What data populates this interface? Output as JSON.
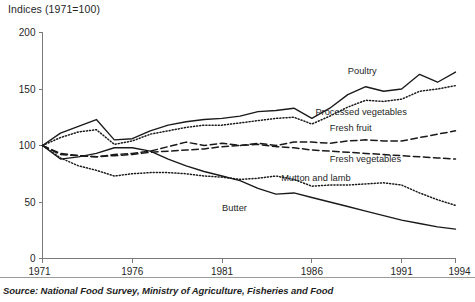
{
  "chart_data": {
    "type": "line",
    "title": "Indices (1971=100)",
    "xlabel": "",
    "ylabel": "Indices (1971=100)",
    "xlim": [
      1971,
      1994
    ],
    "ylim": [
      0,
      200
    ],
    "yticks": [
      0,
      50,
      100,
      150,
      200
    ],
    "xticks": [
      1971,
      1976,
      1981,
      1986,
      1991,
      1994
    ],
    "xtick_labels": [
      "1971",
      "1976",
      "1981",
      "1986",
      "1991",
      "1994"
    ],
    "ytick_labels": [
      "0",
      "50",
      "100",
      "150",
      "200"
    ],
    "grid": false,
    "legend_position": "inline-annotations",
    "x": [
      1971,
      1972,
      1973,
      1974,
      1975,
      1976,
      1977,
      1978,
      1979,
      1980,
      1981,
      1982,
      1983,
      1984,
      1985,
      1986,
      1987,
      1988,
      1989,
      1990,
      1991,
      1992,
      1993,
      1994
    ],
    "series": [
      {
        "name": "Poultry",
        "style": "solid",
        "label": "Poultry",
        "values": [
          100,
          111,
          117,
          123,
          105,
          106,
          113,
          118,
          121,
          123,
          124,
          126,
          130,
          131,
          133,
          124,
          133,
          145,
          152,
          148,
          150,
          163,
          156,
          165
        ]
      },
      {
        "name": "Processed vegetables",
        "style": "dotted",
        "label": "Processed vegetables",
        "values": [
          100,
          107,
          112,
          114,
          101,
          104,
          110,
          113,
          116,
          118,
          118,
          120,
          122,
          124,
          125,
          119,
          126,
          134,
          140,
          139,
          141,
          148,
          150,
          153
        ]
      },
      {
        "name": "Fresh fruit",
        "style": "dashed",
        "label": "Fresh fruit",
        "values": [
          100,
          92,
          91,
          90,
          92,
          93,
          95,
          99,
          103,
          100,
          102,
          100,
          102,
          100,
          103,
          103,
          102,
          104,
          105,
          104,
          104,
          107,
          110,
          113
        ]
      },
      {
        "name": "Fresh vegetables",
        "style": "dashed",
        "label": "Fresh vegetables",
        "values": [
          100,
          93,
          91,
          90,
          91,
          92,
          94,
          95,
          96,
          97,
          99,
          100,
          101,
          99,
          98,
          96,
          95,
          94,
          93,
          92,
          91,
          90,
          89,
          88
        ]
      },
      {
        "name": "Mutton and lamb",
        "style": "dotted",
        "label": "Mutton and lamb",
        "values": [
          100,
          89,
          82,
          78,
          73,
          75,
          76,
          76,
          75,
          73,
          72,
          70,
          71,
          73,
          70,
          64,
          65,
          65,
          66,
          67,
          65,
          58,
          52,
          47
        ]
      },
      {
        "name": "Butter",
        "style": "solid",
        "label": "Butter",
        "values": [
          100,
          88,
          90,
          93,
          98,
          98,
          95,
          88,
          82,
          77,
          73,
          69,
          62,
          57,
          58,
          54,
          50,
          46,
          42,
          38,
          34,
          31,
          28,
          26
        ]
      }
    ],
    "annotations": [
      {
        "text": "Poultry",
        "x": 1988.0,
        "y": 163
      },
      {
        "text": "Processed vegetables",
        "x": 1986.2,
        "y": 127
      },
      {
        "text": "Fresh fruit",
        "x": 1987.0,
        "y": 113
      },
      {
        "text": "Fresh vegetables",
        "x": 1987.0,
        "y": 85
      },
      {
        "text": "Mutton and lamb",
        "x": 1984.3,
        "y": 69
      },
      {
        "text": "Butter",
        "x": 1981.0,
        "y": 42
      }
    ],
    "source": "Source: National Food Survey, Ministry of Agriculture, Fisheries and Food"
  }
}
